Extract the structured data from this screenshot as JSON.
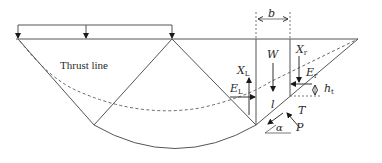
{
  "diagram": {
    "type": "slope-stability-slice-diagram",
    "colors": {
      "line": "#555555",
      "arrow": "#1a1a1a",
      "text": "#2a2a2a",
      "background": "#ffffff"
    },
    "labels": {
      "thrust_line": "Thrust line",
      "slice_width": "b",
      "weight": "W",
      "left_shear": {
        "main": "X",
        "sub": "L"
      },
      "right_shear": {
        "main": "X",
        "sub": "r"
      },
      "left_normal": {
        "main": "E",
        "sub": "L"
      },
      "right_normal": {
        "main": "E",
        "sub": "r"
      },
      "thrust_height": {
        "main": "h",
        "sub": "t"
      },
      "base_length": "l",
      "shear_force": "T",
      "normal_force": "P",
      "base_angle": "α"
    }
  }
}
